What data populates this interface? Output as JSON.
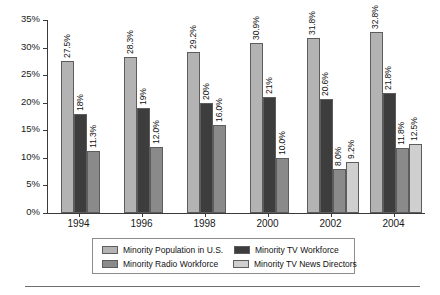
{
  "chart_data": {
    "type": "bar",
    "title": "",
    "xlabel": "",
    "ylabel": "",
    "ylim": [
      0,
      35
    ],
    "ytick_labels": [
      "0%",
      "5%",
      "10%",
      "15%",
      "20%",
      "25%",
      "30%",
      "35%"
    ],
    "ytick_values": [
      0,
      5,
      10,
      15,
      20,
      25,
      30,
      35
    ],
    "grid": false,
    "legend_position": "bottom",
    "categories": [
      "1994",
      "1996",
      "1998",
      "2000",
      "2002",
      "2004"
    ],
    "series": [
      {
        "name": "Minority Population in U.S.",
        "color": "#b3b3b3",
        "values": [
          27.5,
          28.3,
          29.2,
          30.9,
          31.8,
          32.8
        ],
        "labels": [
          "27.5%",
          "28.3%",
          "29.2%",
          "30.9%",
          "31.8%",
          "32.8%"
        ]
      },
      {
        "name": "Minority TV Workforce",
        "color": "#3d3d3d",
        "values": [
          18.0,
          19.0,
          20.0,
          21.0,
          20.6,
          21.8
        ],
        "labels": [
          "18%",
          "19%",
          "20%",
          "21%",
          "20.6%",
          "21.8%"
        ]
      },
      {
        "name": "Minority Radio Workforce",
        "color": "#8a8a8a",
        "values": [
          11.3,
          12.0,
          16.0,
          10.0,
          8.0,
          11.8
        ],
        "labels": [
          "11.3%",
          "12.0%",
          "16.0%",
          "10.0%",
          "8.0%",
          "11.8%"
        ]
      },
      {
        "name": "Minority TV News Directors",
        "color": "#cfcfcf",
        "values": [
          null,
          null,
          null,
          null,
          9.2,
          12.5
        ],
        "labels": [
          "",
          "",
          "",
          "",
          "9.2%",
          "12.5%"
        ]
      }
    ]
  },
  "legend": {
    "items": [
      {
        "label": "Minority Population in U.S.",
        "color": "#b3b3b3"
      },
      {
        "label": "Minority TV Workforce",
        "color": "#3d3d3d"
      },
      {
        "label": "Minority Radio Workforce",
        "color": "#8a8a8a"
      },
      {
        "label": "Minority TV News Directors",
        "color": "#cfcfcf"
      }
    ]
  }
}
